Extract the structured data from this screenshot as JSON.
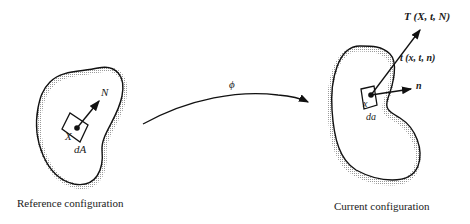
{
  "diagram": {
    "reference": {
      "caption": "Reference configuration",
      "point_label": "X",
      "area_label": "dA",
      "normal_label": "N"
    },
    "current": {
      "caption": "Current configuration",
      "point_label": "x",
      "area_label": "da",
      "normal_label": "n",
      "traction_T_label": "T (X, t, N)",
      "traction_t_label": "t (x, t, n)"
    },
    "mapping": {
      "label": "ϕ"
    }
  }
}
